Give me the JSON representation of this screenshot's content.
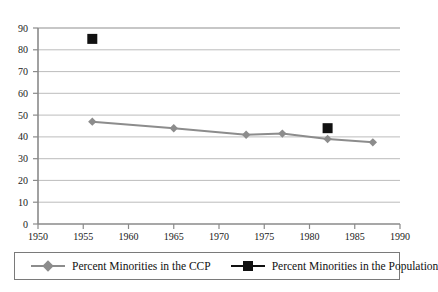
{
  "chart_data": {
    "type": "line",
    "title": "",
    "xlabel": "",
    "ylabel": "",
    "xlim": [
      1950,
      1990
    ],
    "ylim": [
      0,
      90
    ],
    "xticks": [
      1950,
      1955,
      1960,
      1965,
      1970,
      1975,
      1980,
      1985,
      1990
    ],
    "yticks": [
      0,
      10,
      20,
      30,
      40,
      50,
      60,
      70,
      80,
      90
    ],
    "grid": "horizontal",
    "legend_position": "bottom",
    "series": [
      {
        "name": "Percent Minorities in the CCP",
        "marker": "diamond",
        "color": "#8c8c8c",
        "line": true,
        "x": [
          1956,
          1965,
          1973,
          1977,
          1982,
          1987
        ],
        "values": [
          47,
          44,
          41,
          41.5,
          39,
          37.5
        ]
      },
      {
        "name": "Percent Minorities in the Population",
        "marker": "square",
        "color": "#111111",
        "line": false,
        "x": [
          1956,
          1982
        ],
        "values": [
          85,
          44
        ]
      }
    ]
  },
  "axes": {
    "y_tick_labels": [
      "90",
      "80",
      "70",
      "60",
      "50",
      "40",
      "30",
      "20",
      "10",
      "0"
    ],
    "x_tick_labels": [
      "1950",
      "1955",
      "1960",
      "1965",
      "1970",
      "1975",
      "1980",
      "1985",
      "1990"
    ]
  },
  "legend": {
    "items": [
      {
        "label": "Percent Minorities in the CCP",
        "marker": "diamond-marker",
        "color": "#8c8c8c"
      },
      {
        "label": "Percent Minorities in the Population",
        "marker": "square-marker",
        "color": "#111111"
      }
    ]
  },
  "colors": {
    "series_line": "#8c8c8c",
    "series_square": "#111111",
    "gridline": "#b9b9b9",
    "axis": "#8a8a8a",
    "text": "#1a1a1a",
    "legend_border": "#7a7a7a",
    "background": "#ffffff"
  }
}
